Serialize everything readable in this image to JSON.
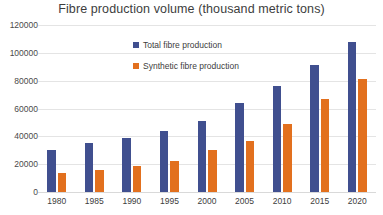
{
  "chart_data": {
    "type": "bar",
    "title": "Fibre production volume (thousand metric tons)",
    "xlabel": "",
    "ylabel": "",
    "categories": [
      "1980",
      "1985",
      "1990",
      "1995",
      "2000",
      "2005",
      "2010",
      "2015",
      "2020"
    ],
    "series": [
      {
        "name": "Total fibre production",
        "color": "#404F8F",
        "values": [
          30000,
          35000,
          39000,
          44000,
          51000,
          64000,
          76000,
          91000,
          108000
        ]
      },
      {
        "name": "Synthetic fibre production",
        "color": "#E2701E",
        "values": [
          14000,
          16000,
          18500,
          22000,
          30000,
          37000,
          49000,
          67000,
          81000
        ]
      }
    ],
    "ylim": [
      0,
      120000
    ],
    "yticks": [
      0,
      20000,
      40000,
      60000,
      80000,
      100000,
      120000
    ],
    "ytick_labels": [
      "0",
      "20000",
      "40000",
      "60000",
      "80000",
      "100000",
      "120000"
    ],
    "grid": true,
    "legend_position": "inside-top-left"
  },
  "colors": {
    "total": "#404F8F",
    "synthetic": "#E2701E",
    "gridline": "#e4e4e4",
    "text": "#3d3d3d",
    "background": "#ffffff"
  }
}
